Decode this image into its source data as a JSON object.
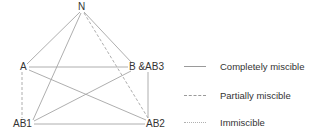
{
  "diagram": {
    "nodes": {
      "N": "N",
      "A": "A",
      "B": "B &AB3",
      "AB1": "AB1",
      "AB2": "AB2"
    },
    "edges": [
      {
        "from": "N",
        "to": "A",
        "type": "completely miscible"
      },
      {
        "from": "N",
        "to": "B &AB3",
        "type": "completely miscible"
      },
      {
        "from": "N",
        "to": "AB1",
        "type": "completely miscible"
      },
      {
        "from": "N",
        "to": "AB2",
        "type": "partially miscible"
      },
      {
        "from": "A",
        "to": "B &AB3",
        "type": "completely miscible"
      },
      {
        "from": "A",
        "to": "AB1",
        "type": "partially miscible"
      },
      {
        "from": "A",
        "to": "AB2",
        "type": "completely miscible"
      },
      {
        "from": "B &AB3",
        "to": "AB1",
        "type": "completely miscible"
      },
      {
        "from": "B &AB3",
        "to": "AB2",
        "type": "completely miscible"
      },
      {
        "from": "AB1",
        "to": "AB2",
        "type": "completely miscible"
      }
    ],
    "line_color": "#9a9a9a"
  },
  "legend": {
    "completely": "Completely miscible",
    "partially": "Partially miscible",
    "immiscible": "Immiscible"
  }
}
